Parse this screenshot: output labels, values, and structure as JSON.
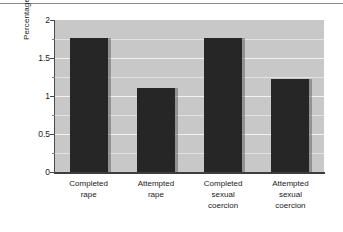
{
  "chart_data": {
    "type": "bar",
    "title": "",
    "xlabel": "",
    "ylabel": "Percentage",
    "categories": [
      "Completed rape",
      "Attempted rape",
      "Completed sexual coercion",
      "Attempted sexual coercion"
    ],
    "category_lines": [
      [
        "Completed",
        "rape"
      ],
      [
        "Attempted",
        "rape"
      ],
      [
        "Completed",
        "sexual",
        "coercion"
      ],
      [
        "Attempted",
        "sexual",
        "coercion"
      ]
    ],
    "values": [
      1.76,
      1.11,
      1.77,
      1.22
    ],
    "ylim": [
      0,
      2
    ],
    "ytick_labels": [
      "0",
      "0.5",
      "1",
      "1.5",
      "2"
    ],
    "ytick_values": [
      0,
      0.5,
      1,
      1.5,
      2
    ],
    "minor_ytick_values": [
      0.25,
      0.75,
      1.25,
      1.75
    ],
    "grid": true,
    "legend": "none",
    "colors": {
      "bar": "#262626",
      "plot_background": "#c8c8c8",
      "gridline": "#f2f2f2",
      "axis": "#3d3d3d",
      "figure_background": "#ffffff",
      "text": "#1a1a1a"
    }
  }
}
